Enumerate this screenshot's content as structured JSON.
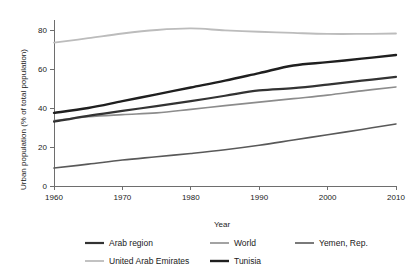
{
  "chart_data": {
    "type": "line",
    "title": "",
    "xlabel": "Year",
    "ylabel": "Urban population (% of total population)",
    "xlim": [
      1960,
      2010
    ],
    "ylim": [
      0,
      85
    ],
    "xticks": [
      1960,
      1970,
      1980,
      1990,
      2000,
      2010
    ],
    "yticks": [
      0,
      20,
      40,
      60,
      80
    ],
    "grid": false,
    "legend_position": "bottom",
    "x": [
      1960,
      1965,
      1970,
      1975,
      1980,
      1985,
      1990,
      1995,
      2000,
      2005,
      2010
    ],
    "series": [
      {
        "name": "Arab region",
        "color": "#333333",
        "width": 2.2,
        "values": [
          33.0,
          36.0,
          38.5,
          41.0,
          43.5,
          46.3,
          49.0,
          50.2,
          52.0,
          54.0,
          56.0
        ]
      },
      {
        "name": "World",
        "color": "#8c8c8c",
        "width": 1.6,
        "values": [
          33.6,
          35.5,
          36.6,
          37.5,
          39.3,
          41.2,
          43.0,
          44.8,
          46.6,
          48.8,
          50.8
        ]
      },
      {
        "name": "Yemen, Rep.",
        "color": "#595959",
        "width": 1.6,
        "values": [
          9.2,
          11.2,
          13.3,
          15.0,
          16.7,
          18.6,
          20.9,
          23.6,
          26.3,
          29.0,
          31.8
        ]
      },
      {
        "name": "United Arab Emirates",
        "color": "#bcbcbc",
        "width": 1.8,
        "values": [
          73.5,
          75.8,
          78.2,
          80.0,
          80.8,
          79.8,
          79.1,
          78.5,
          78.0,
          78.0,
          78.2
        ]
      },
      {
        "name": "Tunisia",
        "color": "#1f1f1f",
        "width": 2.4,
        "values": [
          37.5,
          40.0,
          43.5,
          47.0,
          50.5,
          54.0,
          57.9,
          61.8,
          63.5,
          65.3,
          67.2
        ]
      }
    ]
  },
  "axes": {
    "x_label": "Year",
    "y_label": "Urban population (% of total population)",
    "x_tick_labels": [
      "1960",
      "1970",
      "1980",
      "1990",
      "2000",
      "2010"
    ],
    "y_tick_labels": [
      "0",
      "20",
      "40",
      "60",
      "80"
    ]
  },
  "legend": {
    "row1": [
      {
        "label": "Arab region",
        "color": "#333333",
        "width": 2.2
      },
      {
        "label": "World",
        "color": "#8c8c8c",
        "width": 1.6
      },
      {
        "label": "Yemen, Rep.",
        "color": "#595959",
        "width": 1.6
      }
    ],
    "row2": [
      {
        "label": "United Arab Emirates",
        "color": "#bcbcbc",
        "width": 1.8
      },
      {
        "label": "Tunisia",
        "color": "#1f1f1f",
        "width": 2.4
      }
    ]
  },
  "colors": {
    "axis": "#6e6e6e",
    "text": "#1a1a1a",
    "background": "#ffffff"
  }
}
